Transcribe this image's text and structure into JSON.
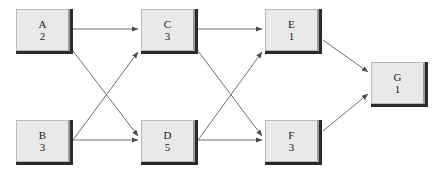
{
  "diagram": {
    "type": "directed-graph",
    "background_color": "#ffffff",
    "node_fill_color": "#e9e9e9",
    "node_border_color": "#b9b9b9",
    "node_shadow_color": "#2b2b2b",
    "edge_color": "#6f6f6f",
    "nodes": [
      {
        "id": "A",
        "label": "A",
        "duration": "2",
        "x": 16,
        "y": 9
      },
      {
        "id": "B",
        "label": "B",
        "duration": "3",
        "x": 16,
        "y": 120
      },
      {
        "id": "C",
        "label": "C",
        "duration": "3",
        "x": 141,
        "y": 9
      },
      {
        "id": "D",
        "label": "D",
        "duration": "5",
        "x": 141,
        "y": 120
      },
      {
        "id": "E",
        "label": "E",
        "duration": "1",
        "x": 265,
        "y": 9
      },
      {
        "id": "F",
        "label": "F",
        "duration": "3",
        "x": 265,
        "y": 120
      },
      {
        "id": "G",
        "label": "G",
        "duration": "1",
        "x": 371,
        "y": 62
      }
    ],
    "edges": [
      {
        "from": "A",
        "to": "C",
        "x1": 73,
        "y1": 29,
        "x2": 138,
        "y2": 29
      },
      {
        "from": "A",
        "to": "D",
        "x1": 73,
        "y1": 51,
        "x2": 138,
        "y2": 136
      },
      {
        "from": "B",
        "to": "C",
        "x1": 73,
        "y1": 140,
        "x2": 138,
        "y2": 52
      },
      {
        "from": "B",
        "to": "D",
        "x1": 73,
        "y1": 140,
        "x2": 138,
        "y2": 140
      },
      {
        "from": "C",
        "to": "E",
        "x1": 198,
        "y1": 29,
        "x2": 262,
        "y2": 29
      },
      {
        "from": "C",
        "to": "F",
        "x1": 198,
        "y1": 51,
        "x2": 262,
        "y2": 136
      },
      {
        "from": "D",
        "to": "E",
        "x1": 198,
        "y1": 140,
        "x2": 262,
        "y2": 52
      },
      {
        "from": "D",
        "to": "F",
        "x1": 198,
        "y1": 140,
        "x2": 262,
        "y2": 140
      },
      {
        "from": "E",
        "to": "G",
        "x1": 323,
        "y1": 40,
        "x2": 368,
        "y2": 72
      },
      {
        "from": "F",
        "to": "G",
        "x1": 323,
        "y1": 131,
        "x2": 368,
        "y2": 94
      }
    ]
  }
}
